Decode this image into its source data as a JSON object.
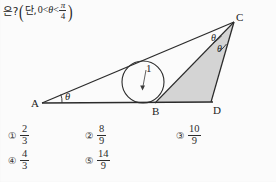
{
  "question": {
    "prompt_lead": "은?",
    "paren_open": "(",
    "paren_close": ")",
    "condition_label": "단,",
    "condition_lower": "0",
    "rel1": "<",
    "theta": "θ",
    "rel2": "<",
    "bound_numerator": "π",
    "bound_denominator": "4"
  },
  "figure": {
    "type": "geometry-diagram",
    "vertices": [
      {
        "label": "A",
        "x": 42,
        "y": 93
      },
      {
        "label": "B",
        "x": 155,
        "y": 93
      },
      {
        "label": "C",
        "x": 234,
        "y": 12
      },
      {
        "label": "D",
        "x": 210,
        "y": 92
      }
    ],
    "vertex_labels": {
      "A": "A",
      "B": "B",
      "C": "C",
      "D": "D"
    },
    "angles": [
      {
        "at": "A",
        "label": "θ",
        "between": "AD-AC"
      },
      {
        "at": "C",
        "label": "θ",
        "between": "CA-CB"
      },
      {
        "at": "C",
        "label": "θ",
        "between": "CB-CD"
      }
    ],
    "incircle": {
      "label": "1",
      "radius_label": "1",
      "center_x": 143,
      "center_y": 72,
      "radius": 21
    },
    "shaded_region": "triangle BCD",
    "shade_color": "#c9c9c9",
    "line_color": "#2b2b2b"
  },
  "choices": [
    {
      "marker": "①",
      "numerator": "2",
      "denominator": "3"
    },
    {
      "marker": "②",
      "numerator": "8",
      "denominator": "9"
    },
    {
      "marker": "③",
      "numerator": "10",
      "denominator": "9"
    },
    {
      "marker": "④",
      "numerator": "4",
      "denominator": "3"
    },
    {
      "marker": "⑤",
      "numerator": "14",
      "denominator": "9"
    }
  ]
}
